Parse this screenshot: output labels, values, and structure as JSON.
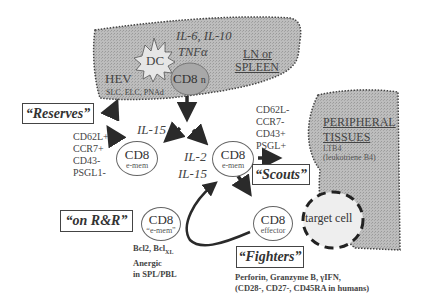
{
  "diagram": {
    "lymphoid_region": {
      "label_line1": "LN or",
      "label_line2": "SPLEEN",
      "dc_label": "DC",
      "cytokines_line1": "IL-6, IL-10",
      "cytokines_line2": "TNFα",
      "hev_label": "HEV",
      "hev_sub": "SLC, ELC, PNAd",
      "naive_cell": {
        "main": "CD8",
        "sub": "n"
      }
    },
    "peripheral_region": {
      "label_line1": "PERIPHERAL",
      "label_line2": "TISSUES",
      "sub_line1": "LTB4",
      "sub_line2": "(leukotriene B4)"
    },
    "reserves": {
      "label": "“Reserves”",
      "markers": [
        "CD62L+",
        "CCR7+",
        "CD43-",
        "PSGL1-"
      ],
      "cell": {
        "main": "CD8",
        "sub": "e-mem"
      },
      "cytokine": "IL-15"
    },
    "scouts": {
      "label": "“Scouts”",
      "markers": [
        "CD62L-",
        "CCR7-",
        "CD43+",
        "PSGL+"
      ],
      "cell": {
        "main": "CD8",
        "sub": "e-mem"
      },
      "cytokine_line1": "IL-2",
      "cytokine_line2": "IL-15"
    },
    "on_rr": {
      "label": "“on R&R”",
      "cell": {
        "main": "CD8",
        "sub": "“e-mem”"
      },
      "desc_line1": "Bcl2, Bcl",
      "desc_line1_sub": "XL",
      "desc_line2": "Anergic",
      "desc_line3": "in SPL/PBL"
    },
    "fighters": {
      "label": "“Fighters”",
      "cell": {
        "main": "CD8",
        "sub": "effector"
      },
      "target": "target cell",
      "desc_line1": "Perforin, Granzyme B, γIFN,",
      "desc_line2": "(CD28-,  CD27-, CD45RA in humans)"
    },
    "colors": {
      "region_fill": "#b5b5b5",
      "naive_fill": "#a8a8a8",
      "arrow": "#2a2a2a",
      "target_fill": "#eeeeee"
    }
  }
}
